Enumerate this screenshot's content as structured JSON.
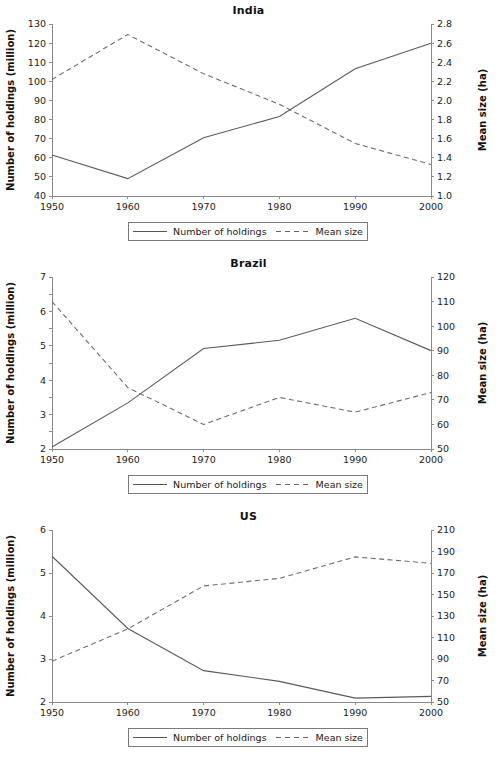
{
  "legend": {
    "entries": [
      {
        "label": "Number of holdings",
        "style": "solid"
      },
      {
        "label": "Mean size",
        "style": "dashed"
      }
    ]
  },
  "axis_titles": {
    "left": "Number of holdings (million)",
    "right": "Mean size (ha)"
  },
  "colors": {
    "solid_line": "#5a5a5a",
    "dashed_line": "#6d6d6d",
    "axis": "#8a8a8a",
    "text": "#1a1a1a",
    "background": "#ffffff"
  },
  "chart_data": [
    {
      "type": "line",
      "title": "India",
      "xlabel": "",
      "ylabel": "Number of holdings (million)",
      "y2label": "Mean size (ha)",
      "grid": false,
      "legend_position": "below",
      "x": [
        1950,
        1960,
        1970,
        1980,
        1990,
        2000
      ],
      "xtick_labels": [
        "1950",
        "1960",
        "1970",
        "1980",
        "1990",
        "2000"
      ],
      "xlim": [
        1950,
        2000
      ],
      "ylim": [
        40,
        130
      ],
      "ytick_labels": [
        "40",
        "50",
        "60",
        "70",
        "80",
        "90",
        "100",
        "110",
        "120",
        "130"
      ],
      "yticks": [
        40,
        50,
        60,
        70,
        80,
        90,
        100,
        110,
        120,
        130
      ],
      "y2lim": [
        1.0,
        2.8
      ],
      "y2tick_labels": [
        "1.0",
        "1.2",
        "1.4",
        "1.6",
        "1.8",
        "2.0",
        "2.2",
        "2.4",
        "2.6",
        "2.8"
      ],
      "y2ticks": [
        1.0,
        1.2,
        1.4,
        1.6,
        1.8,
        2.0,
        2.2,
        2.4,
        2.6,
        2.8
      ],
      "series": [
        {
          "name": "Number of holdings",
          "axis": "left",
          "style": "solid",
          "values": [
            61.5,
            49.1,
            70.5,
            81.6,
            106.6,
            119.9
          ]
        },
        {
          "name": "Mean size",
          "axis": "right",
          "style": "dashed",
          "values": [
            2.22,
            2.69,
            2.28,
            1.96,
            1.55,
            1.33
          ]
        }
      ]
    },
    {
      "type": "line",
      "title": "Brazil",
      "xlabel": "",
      "ylabel": "Number of holdings (million)",
      "y2label": "Mean size (ha)",
      "grid": false,
      "legend_position": "below",
      "x": [
        1950,
        1960,
        1970,
        1980,
        1990,
        2000
      ],
      "xtick_labels": [
        "1950",
        "1960",
        "1970",
        "1980",
        "1990",
        "2000"
      ],
      "xlim": [
        1950,
        2000
      ],
      "ylim": [
        2,
        7
      ],
      "ytick_labels": [
        "2",
        "2.5",
        "3",
        "3.5",
        "4",
        "4.5",
        "5",
        "5.5",
        "6",
        "6.5",
        "7"
      ],
      "yticks": [
        2,
        2.5,
        3,
        3.5,
        4,
        4.5,
        5,
        5.5,
        6,
        6.5,
        7
      ],
      "y2lim": [
        50,
        120
      ],
      "y2tick_labels": [
        "50",
        "60",
        "70",
        "80",
        "90",
        "100",
        "110",
        "120"
      ],
      "y2ticks": [
        50,
        60,
        70,
        80,
        90,
        100,
        110,
        120
      ],
      "series": [
        {
          "name": "Number of holdings",
          "axis": "left",
          "style": "solid",
          "values": [
            2.06,
            3.34,
            4.92,
            5.16,
            5.8,
            4.86
          ]
        },
        {
          "name": "Mean size",
          "axis": "right",
          "style": "dashed",
          "values": [
            110,
            75,
            60,
            71,
            65,
            73
          ]
        }
      ]
    },
    {
      "type": "line",
      "title": "US",
      "xlabel": "",
      "ylabel": "Number of holdings (million)",
      "y2label": "Mean size (ha)",
      "grid": false,
      "legend_position": "below",
      "x": [
        1950,
        1960,
        1970,
        1980,
        1990,
        2000
      ],
      "xtick_labels": [
        "1950",
        "1960",
        "1970",
        "1980",
        "1990",
        "2000"
      ],
      "xlim": [
        1950,
        2000
      ],
      "ylim": [
        2,
        6
      ],
      "ytick_labels": [
        "2",
        "3",
        "4",
        "5",
        "6"
      ],
      "yticks": [
        2,
        3,
        4,
        5,
        6
      ],
      "y2lim": [
        50,
        210
      ],
      "y2tick_labels": [
        "50",
        "70",
        "90",
        "110",
        "130",
        "150",
        "170",
        "190",
        "210"
      ],
      "y2ticks": [
        50,
        70,
        90,
        110,
        130,
        150,
        170,
        190,
        210
      ],
      "series": [
        {
          "name": "Number of holdings",
          "axis": "left",
          "style": "solid",
          "values": [
            5.39,
            3.71,
            2.73,
            2.48,
            2.09,
            2.13
          ]
        },
        {
          "name": "Mean size",
          "axis": "right",
          "style": "dashed",
          "values": [
            88,
            118,
            158,
            165,
            185,
            179
          ]
        }
      ]
    }
  ]
}
